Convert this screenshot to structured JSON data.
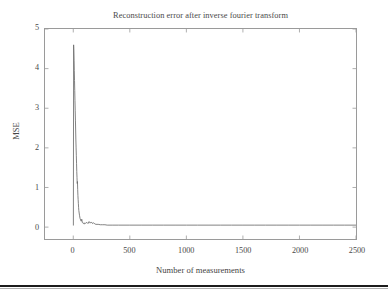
{
  "figure": {
    "background_color": "#ffffff",
    "axes_color": "#9a9a9a",
    "line_color": "#6b6b6b",
    "text_color": "#4a4a4a"
  },
  "chart_data": {
    "type": "line",
    "title": "Reconstruction error after inverse fourier transform",
    "xlabel": "Number of measurements",
    "ylabel": "MSE",
    "xlim": [
      -250,
      2500
    ],
    "ylim": [
      -0.3,
      5
    ],
    "xticks": [
      0,
      500,
      1000,
      1500,
      2000,
      2500
    ],
    "xticklabels": [
      "0",
      "500",
      "1000",
      "1500",
      "2000",
      "2500"
    ],
    "yticks": [
      0,
      1,
      2,
      3,
      4,
      5
    ],
    "yticklabels": [
      "0",
      "1",
      "2",
      "3",
      "4",
      "5"
    ],
    "grid": false,
    "legend": null,
    "series": [
      {
        "name": "MSE",
        "x": [
          1,
          3,
          5,
          7,
          9,
          11,
          13,
          15,
          17,
          19,
          21,
          23,
          25,
          27,
          29,
          31,
          33,
          35,
          37,
          39,
          41,
          43,
          45,
          47,
          49,
          55,
          60,
          65,
          70,
          75,
          80,
          85,
          90,
          95,
          100,
          110,
          120,
          130,
          140,
          150,
          160,
          170,
          180,
          190,
          200,
          220,
          240,
          260,
          280,
          300,
          350,
          400,
          500,
          600,
          700,
          800,
          900,
          1000,
          1100,
          1200,
          1300,
          1400,
          1500,
          1600,
          1700,
          1800,
          1900,
          2000,
          2100,
          2200,
          2300,
          2400,
          2500
        ],
        "y": [
          0.05,
          4.6,
          4.45,
          4.2,
          3.95,
          3.7,
          3.45,
          3.2,
          2.95,
          2.7,
          2.45,
          2.2,
          2.0,
          1.8,
          1.6,
          1.4,
          1.25,
          1.1,
          1.15,
          0.95,
          0.8,
          0.7,
          0.6,
          0.5,
          0.42,
          0.3,
          0.22,
          0.18,
          0.15,
          0.2,
          0.12,
          0.1,
          0.09,
          0.11,
          0.08,
          0.1,
          0.12,
          0.09,
          0.14,
          0.1,
          0.13,
          0.09,
          0.11,
          0.08,
          0.07,
          0.07,
          0.06,
          0.06,
          0.06,
          0.05,
          0.05,
          0.05,
          0.05,
          0.05,
          0.05,
          0.05,
          0.05,
          0.05,
          0.05,
          0.05,
          0.05,
          0.05,
          0.05,
          0.05,
          0.05,
          0.05,
          0.05,
          0.05,
          0.05,
          0.05,
          0.05,
          0.05,
          0.05
        ]
      }
    ],
    "peak": {
      "x": 3,
      "y": 4.6
    }
  }
}
